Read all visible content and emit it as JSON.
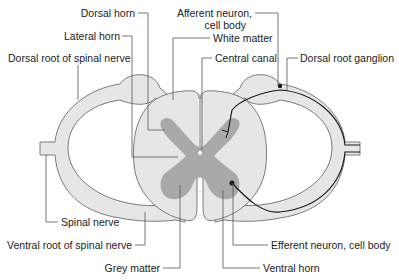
{
  "diagram": {
    "colors": {
      "white_matter": "#e6e6e6",
      "grey_matter": "#a9a9a9",
      "outline": "#7a7a7a",
      "neuron_path": "#1a1a1a",
      "leader_line": "#555555",
      "text": "#222222"
    },
    "labels": {
      "dorsal_horn": "Dorsal horn",
      "lateral_horn": "Lateral horn",
      "dorsal_root": "Dorsal root of spinal nerve",
      "afferent_line1": "Afferent neuron,",
      "afferent_line2": "cell body",
      "white_matter": "White matter",
      "central_canal": "Central canal",
      "dorsal_root_ganglion": "Dorsal root ganglion",
      "spinal_nerve": "Spinal nerve",
      "ventral_root": "Ventral root of spinal nerve",
      "grey_matter": "Grey matter",
      "efferent": "Efferent neuron, cell body",
      "ventral_horn": "Ventral horn"
    }
  }
}
